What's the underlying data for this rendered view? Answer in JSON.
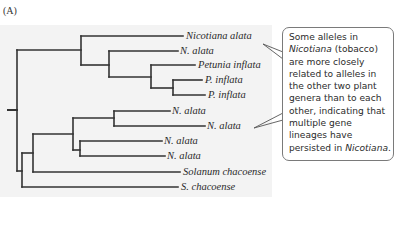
{
  "figure": {
    "panel_label": "(A)",
    "background_color": "#f3f3f3",
    "line_color": "#333333"
  },
  "tree": {
    "leaves": [
      {
        "id": 0,
        "label": "Nicotiana alata",
        "y": 36,
        "x_end": 183
      },
      {
        "id": 1,
        "label": "N. alata",
        "y": 51,
        "x_end": 178
      },
      {
        "id": 2,
        "label": "Petunia inflata",
        "y": 65,
        "x_end": 195
      },
      {
        "id": 3,
        "label": "P. inflata",
        "y": 80,
        "x_end": 202
      },
      {
        "id": 4,
        "label": "P. inflata",
        "y": 95,
        "x_end": 205
      },
      {
        "id": 5,
        "label": "N. alata",
        "y": 111,
        "x_end": 170
      },
      {
        "id": 6,
        "label": "N. alata",
        "y": 126,
        "x_end": 205
      },
      {
        "id": 7,
        "label": "N. alata",
        "y": 141,
        "x_end": 162
      },
      {
        "id": 8,
        "label": "N. alata",
        "y": 156,
        "x_end": 165
      },
      {
        "id": 9,
        "label": "Solanum chacoense",
        "y": 172,
        "x_end": 180
      },
      {
        "id": 10,
        "label": "S. chacoense",
        "y": 187,
        "x_end": 178
      }
    ]
  },
  "callout": {
    "text_parts": [
      {
        "text": "Some alleles in ",
        "italic": false
      },
      {
        "text": "Nicotiana",
        "italic": true
      },
      {
        "text": " (tobacco) are more closely related to alleles in the other two plant genera than to each other, indicating that multiple gene lineages have persisted in ",
        "italic": false
      },
      {
        "text": "Nicotiana",
        "italic": true
      },
      {
        "text": ".",
        "italic": false
      }
    ],
    "line1": "Some alleles in",
    "line2_italic": "Nicotiana",
    "line2_rest": " (tobacco)",
    "line3": "are more closely",
    "line4": "related to alleles in",
    "line5": "the other two plant",
    "line6": "genera than to each",
    "line7": "other, indicating that",
    "line8": "multiple gene",
    "line9": "lineages have",
    "line10_start": "persisted in ",
    "line10_italic": "Nicotiana",
    "line10_end": "."
  }
}
